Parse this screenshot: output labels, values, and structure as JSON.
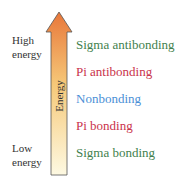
{
  "axis": {
    "label": "Energy",
    "high_label": [
      "High",
      "energy"
    ],
    "low_label": [
      "Low",
      "energy"
    ],
    "gradient_top": "#e8773a",
    "gradient_mid": "#f6c979",
    "gradient_bottom": "#fdf9e2"
  },
  "levels": [
    {
      "label": "Sigma antibonding",
      "color": "#3f7f4d"
    },
    {
      "label": "Pi antibonding",
      "color": "#c9324b"
    },
    {
      "label": "Nonbonding",
      "color": "#4a8fd6"
    },
    {
      "label": "Pi bonding",
      "color": "#c9324b"
    },
    {
      "label": "Sigma bonding",
      "color": "#3f7f4d"
    }
  ]
}
